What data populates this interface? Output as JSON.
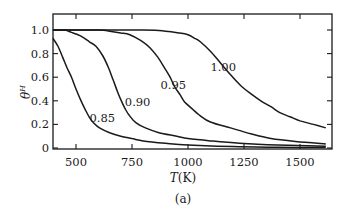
{
  "chart_data": {
    "type": "line",
    "title": "",
    "caption": "(a)",
    "xlabel": "T(K)",
    "ylabel": "θ^H",
    "xlabel_parts": {
      "italic": "T",
      "rest": "(K)"
    },
    "ylabel_parts": {
      "base": "θ",
      "sup": "H"
    },
    "xlim": [
      397,
      1637
    ],
    "ylim": [
      0,
      1.1
    ],
    "grid": false,
    "legend": "inline curve labels",
    "xticks": [
      500,
      750,
      1000,
      1250,
      1500
    ],
    "xtick_labels": [
      "500",
      "750",
      "1000",
      "1250",
      "1500"
    ],
    "yticks": [
      0,
      0.2,
      0.4,
      0.6,
      0.8,
      1.0
    ],
    "ytick_labels": [
      "0",
      "0.2",
      "0.4",
      "0.6",
      "0.8",
      "1.0"
    ],
    "series": [
      {
        "name": "0.85",
        "label_pos": {
          "T": 560,
          "theta": 0.22
        },
        "points": [
          [
            397,
            0.93
          ],
          [
            420,
            0.86
          ],
          [
            440,
            0.77
          ],
          [
            460,
            0.68
          ],
          [
            480,
            0.6
          ],
          [
            500,
            0.5
          ],
          [
            520,
            0.41
          ],
          [
            540,
            0.33
          ],
          [
            560,
            0.26
          ],
          [
            580,
            0.21
          ],
          [
            605,
            0.17
          ],
          [
            650,
            0.13
          ],
          [
            700,
            0.1
          ],
          [
            750,
            0.08
          ],
          [
            800,
            0.06
          ],
          [
            900,
            0.04
          ],
          [
            1000,
            0.025
          ],
          [
            1200,
            0.012
          ],
          [
            1400,
            0.006
          ],
          [
            1615,
            0.003
          ]
        ]
      },
      {
        "name": "0.90",
        "label_pos": {
          "T": 718,
          "theta": 0.36
        },
        "points": [
          [
            397,
            1.0
          ],
          [
            450,
            1.0
          ],
          [
            480,
            0.98
          ],
          [
            520,
            0.95
          ],
          [
            560,
            0.9
          ],
          [
            590,
            0.86
          ],
          [
            620,
            0.78
          ],
          [
            645,
            0.68
          ],
          [
            665,
            0.58
          ],
          [
            685,
            0.48
          ],
          [
            700,
            0.41
          ],
          [
            720,
            0.33
          ],
          [
            740,
            0.27
          ],
          [
            770,
            0.21
          ],
          [
            810,
            0.17
          ],
          [
            870,
            0.13
          ],
          [
            950,
            0.1
          ],
          [
            1000,
            0.08
          ],
          [
            1100,
            0.06
          ],
          [
            1230,
            0.04
          ],
          [
            1400,
            0.025
          ],
          [
            1615,
            0.015
          ]
        ]
      },
      {
        "name": "0.95",
        "label_pos": {
          "T": 877,
          "theta": 0.5
        },
        "points": [
          [
            397,
            1.0
          ],
          [
            600,
            1.0
          ],
          [
            650,
            0.99
          ],
          [
            700,
            0.975
          ],
          [
            740,
            0.96
          ],
          [
            790,
            0.91
          ],
          [
            830,
            0.85
          ],
          [
            865,
            0.77
          ],
          [
            895,
            0.68
          ],
          [
            920,
            0.6
          ],
          [
            940,
            0.52
          ],
          [
            965,
            0.45
          ],
          [
            985,
            0.39
          ],
          [
            1020,
            0.33
          ],
          [
            1050,
            0.28
          ],
          [
            1100,
            0.22
          ],
          [
            1190,
            0.17
          ],
          [
            1280,
            0.12
          ],
          [
            1370,
            0.08
          ],
          [
            1480,
            0.055
          ],
          [
            1615,
            0.035
          ]
        ]
      },
      {
        "name": "1.00",
        "label_pos": {
          "T": 1100,
          "theta": 0.65
        },
        "points": [
          [
            397,
            1.0
          ],
          [
            800,
            1.0
          ],
          [
            900,
            0.99
          ],
          [
            960,
            0.975
          ],
          [
            1000,
            0.96
          ],
          [
            1030,
            0.93
          ],
          [
            1055,
            0.9
          ],
          [
            1100,
            0.82
          ],
          [
            1145,
            0.72
          ],
          [
            1190,
            0.62
          ],
          [
            1235,
            0.53
          ],
          [
            1280,
            0.46
          ],
          [
            1325,
            0.4
          ],
          [
            1370,
            0.35
          ],
          [
            1410,
            0.3
          ],
          [
            1455,
            0.265
          ],
          [
            1500,
            0.23
          ],
          [
            1560,
            0.2
          ],
          [
            1615,
            0.17
          ]
        ]
      }
    ]
  },
  "layout": {
    "plot_left_px": 53,
    "plot_right_px": 332,
    "plot_top_px": 14,
    "plot_bottom_px": 149,
    "x0_T": 500,
    "x0_px": 76,
    "px_per_K": 0.224,
    "y0_px": 148,
    "px_per_unit": 118
  }
}
